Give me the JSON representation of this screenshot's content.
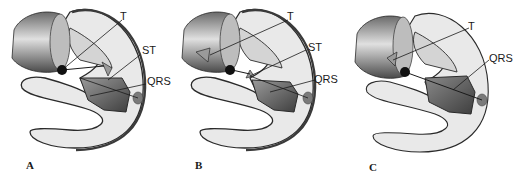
{
  "figure": {
    "colors": {
      "outline": "#2a2a2a",
      "ventricle_fill": "#e9e9e9",
      "ventricle_rim": "#8a8a8a",
      "cylinder_dark": "#5c5c5c",
      "cylinder_light": "#d8d8d8",
      "lesion_fill": "#6b6b6b",
      "electrode": "#111111"
    },
    "panels": [
      {
        "id": "A",
        "letter": "A",
        "labels": {
          "t": "T",
          "st": "ST",
          "qrs": "QRS"
        }
      },
      {
        "id": "B",
        "letter": "B",
        "labels": {
          "t": "T",
          "st": "ST",
          "qrs": "QRS"
        }
      },
      {
        "id": "C",
        "letter": "C",
        "labels": {
          "t": "T",
          "qrs": "QRS"
        }
      }
    ]
  }
}
